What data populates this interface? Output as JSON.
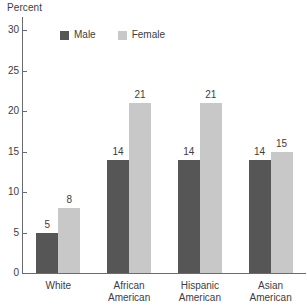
{
  "chart_data": {
    "type": "bar",
    "title": "",
    "subtitle": "",
    "xlabel": "",
    "ylabel": "Percent",
    "ylim": [
      0,
      30
    ],
    "ytick_values": [
      0,
      5,
      10,
      15,
      20,
      25,
      30
    ],
    "ytick_labels": [
      "0",
      "5",
      "10",
      "15",
      "20",
      "25",
      "30"
    ],
    "grid": false,
    "legend_position": "top-left-inside",
    "categories": [
      "White",
      "African American",
      "Hispanic American",
      "Asian American"
    ],
    "category_lines": [
      [
        "White"
      ],
      [
        "African",
        "American"
      ],
      [
        "Hispanic",
        "American"
      ],
      [
        "Asian",
        "American"
      ]
    ],
    "series": [
      {
        "name": "Male",
        "color": "#565656",
        "values": [
          5,
          14,
          14,
          14
        ],
        "value_labels": [
          "5",
          "14",
          "14",
          "14"
        ]
      },
      {
        "name": "Female",
        "color": "#c8c8c8",
        "values": [
          8,
          21,
          21,
          15
        ],
        "value_labels": [
          "8",
          "21",
          "21",
          "15"
        ]
      }
    ],
    "annotations": []
  },
  "legend": {
    "items": [
      {
        "label": "Male",
        "color": "#565656"
      },
      {
        "label": "Female",
        "color": "#c8c8c8"
      }
    ]
  },
  "colors": {
    "male": "#565656",
    "female": "#c8c8c8",
    "axis": "#6b6b6b",
    "text": "#3d3d3d",
    "background": "#ffffff"
  }
}
